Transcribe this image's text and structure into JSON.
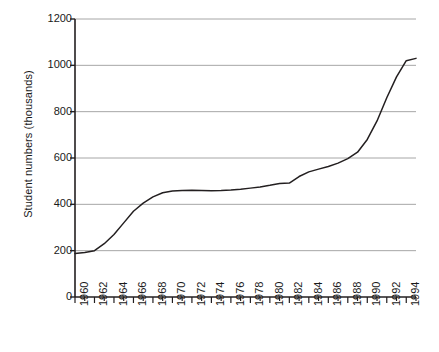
{
  "chart_data": {
    "type": "line",
    "title": "",
    "xlabel": "",
    "ylabel": "Student numbers (thousands)",
    "xlim": [
      1960,
      1995
    ],
    "ylim": [
      0,
      1200
    ],
    "ytick_values": [
      0,
      200,
      400,
      600,
      800,
      1000,
      1200
    ],
    "ytick_labels": [
      "0",
      "200",
      "400",
      "600",
      "800",
      "1000",
      "1200"
    ],
    "xtick_labels": [
      "1960",
      "1962",
      "1964",
      "1966",
      "1968",
      "1970",
      "1972",
      "1974",
      "1976",
      "1978",
      "1980",
      "1982",
      "1984",
      "1986",
      "1988",
      "1990",
      "1992",
      "1994"
    ],
    "xtick_values": [
      1960,
      1962,
      1964,
      1966,
      1968,
      1970,
      1972,
      1974,
      1976,
      1978,
      1980,
      1982,
      1984,
      1986,
      1988,
      1990,
      1992,
      1994
    ],
    "minor_xticks_every": 1,
    "grid": "horizontal",
    "legend": "none",
    "line_color": "#231f20",
    "grid_color": "#a6a6a6",
    "axis_color": "#231f20",
    "x": [
      1960,
      1961,
      1962,
      1963,
      1964,
      1965,
      1966,
      1967,
      1968,
      1969,
      1970,
      1971,
      1972,
      1973,
      1974,
      1975,
      1976,
      1977,
      1978,
      1979,
      1980,
      1981,
      1982,
      1983,
      1984,
      1985,
      1986,
      1987,
      1988,
      1989,
      1990,
      1991,
      1992,
      1993,
      1994,
      1995
    ],
    "values": [
      188,
      192,
      200,
      230,
      270,
      320,
      370,
      405,
      432,
      450,
      458,
      460,
      461,
      460,
      459,
      460,
      462,
      465,
      470,
      475,
      482,
      490,
      492,
      520,
      540,
      552,
      563,
      578,
      597,
      625,
      680,
      760,
      860,
      950,
      1020,
      1030
    ],
    "series": [
      {
        "name": "Student numbers",
        "values": [
          188,
          192,
          200,
          230,
          270,
          320,
          370,
          405,
          432,
          450,
          458,
          460,
          461,
          460,
          459,
          460,
          462,
          465,
          470,
          475,
          482,
          490,
          492,
          520,
          540,
          552,
          563,
          578,
          597,
          625,
          680,
          760,
          860,
          950,
          1020,
          1030
        ]
      }
    ]
  }
}
